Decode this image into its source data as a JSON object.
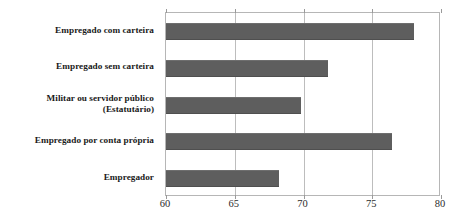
{
  "title_remnant": "",
  "chart_data": {
    "type": "bar",
    "orientation": "horizontal",
    "title": "",
    "subtitle": "",
    "xlabel": "",
    "ylabel": "",
    "xlim": [
      60,
      80
    ],
    "xticks": [
      60,
      65,
      70,
      75,
      80
    ],
    "xtick_labels": [
      "60",
      "65",
      "70",
      "75",
      "80"
    ],
    "grid": true,
    "grid_axis": "x",
    "legend": false,
    "legend_position": "none",
    "bar_color": "#5e5e5e",
    "axis_color": "#b6b6b6",
    "gridline_color": "#bdbdbd",
    "categories": [
      "Empregado com carteira",
      "Empregado sem carteira",
      "Militar ou servidor público (Estatutário)",
      "Empregado por conta própria",
      "Empregador"
    ],
    "category_lines": [
      [
        "Empregado com carteira"
      ],
      [
        "Empregado sem carteira"
      ],
      [
        "Militar ou servidor público",
        "(Estatutário)"
      ],
      [
        "Empregado por conta própria"
      ],
      [
        "Empregador"
      ]
    ],
    "values": [
      78.0,
      71.8,
      69.8,
      76.4,
      68.2
    ],
    "series": [
      {
        "name": "",
        "values": [
          78.0,
          71.8,
          69.8,
          76.4,
          68.2
        ]
      }
    ]
  }
}
